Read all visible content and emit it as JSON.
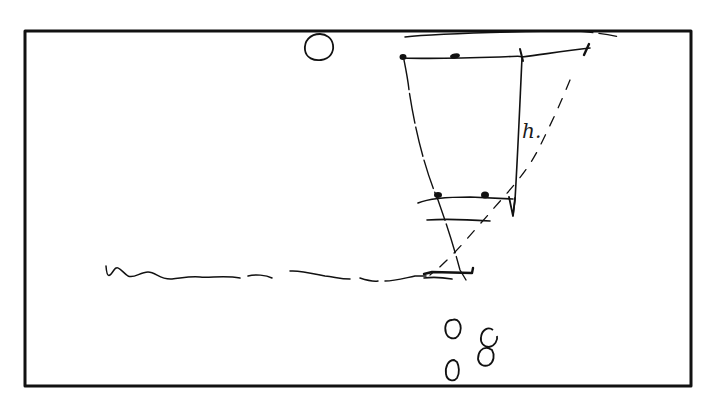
{
  "diagram": {
    "type": "hand-drawn sketch",
    "labels": {
      "height_label": "h."
    },
    "colors": {
      "ink": "#111111",
      "background": "#ffffff"
    },
    "elements": [
      {
        "name": "frame",
        "kind": "rectangle"
      },
      {
        "name": "source-circle",
        "kind": "circle"
      },
      {
        "name": "top-arc",
        "kind": "curve"
      },
      {
        "name": "top-baseline",
        "kind": "line",
        "points": 3
      },
      {
        "name": "height-marker",
        "kind": "vertical-arrow",
        "label": "h."
      },
      {
        "name": "left-ray",
        "kind": "dashed-line"
      },
      {
        "name": "right-ray",
        "kind": "dashed-line"
      },
      {
        "name": "upper-crossbar",
        "kind": "line"
      },
      {
        "name": "pinhole-crossbar",
        "kind": "line"
      },
      {
        "name": "image-triangle",
        "kind": "triangle"
      },
      {
        "name": "ground-wave",
        "kind": "wavy-line"
      },
      {
        "name": "pebbles",
        "kind": "circle-group",
        "count": 4
      }
    ]
  }
}
